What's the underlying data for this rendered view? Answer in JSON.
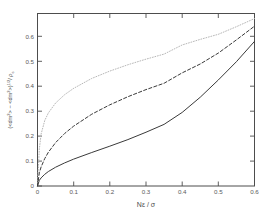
{
  "figure": {
    "background": "#ffffff",
    "frame_color": "#4d4d4d",
    "text_color": "#4a4a4a"
  },
  "axes": {
    "x_title": "Nε / σ",
    "y_title_parts": {
      "p1": "(<dm",
      "p1sup": "2",
      "p2": "> − <dm",
      "p2sup": "2",
      "p3": ">)",
      "p3sup": "1/2",
      "p4": "/ ρ",
      "p4sub": "c"
    },
    "y_title_plain": "(<dm2> - <dm2>)1/2/ ρc",
    "x_ticklabels": [
      "0",
      "0.1",
      "0.2",
      "0.3",
      "0.4",
      "0.5",
      "0.6"
    ],
    "y_ticklabels": [
      "0",
      "0.1",
      "0.2",
      "0.3",
      "0.4",
      "0.5",
      "0.6"
    ]
  },
  "chart_data": {
    "type": "line",
    "title": "",
    "xlabel": "Nε / σ",
    "ylabel": "(<dm^2> - <dm^2>)^(1/2) / ρ_c",
    "xlim": [
      0,
      0.6
    ],
    "ylim": [
      0,
      0.68
    ],
    "xticks": [
      0,
      0.1,
      0.2,
      0.3,
      0.4,
      0.5,
      0.6
    ],
    "yticks": [
      0,
      0.1,
      0.2,
      0.3,
      0.4,
      0.5,
      0.6
    ],
    "grid": false,
    "legend": "none",
    "x": [
      0,
      0.005,
      0.01,
      0.02,
      0.03,
      0.05,
      0.075,
      0.1,
      0.15,
      0.2,
      0.25,
      0.3,
      0.35,
      0.4,
      0.45,
      0.5,
      0.55,
      0.6
    ],
    "series": [
      {
        "name": "dotted-curve",
        "style": "dotted",
        "color": "#b8b8b8",
        "values": [
          0.0,
          0.145,
          0.205,
          0.258,
          0.288,
          0.327,
          0.36,
          0.385,
          0.424,
          0.453,
          0.478,
          0.5,
          0.52,
          0.556,
          0.578,
          0.598,
          0.628,
          0.66
        ]
      },
      {
        "name": "dashed-curve",
        "style": "dashed",
        "color": "#3a3a3a",
        "values": [
          0.0,
          0.052,
          0.075,
          0.108,
          0.133,
          0.171,
          0.207,
          0.236,
          0.283,
          0.32,
          0.352,
          0.38,
          0.405,
          0.446,
          0.481,
          0.524,
          0.576,
          0.63
        ]
      },
      {
        "name": "solid-curve",
        "style": "solid",
        "color": "#3a3a3a",
        "values": [
          0.0,
          0.022,
          0.032,
          0.046,
          0.057,
          0.074,
          0.091,
          0.106,
          0.132,
          0.157,
          0.183,
          0.212,
          0.243,
          0.29,
          0.35,
          0.418,
          0.49,
          0.57
        ]
      }
    ]
  }
}
